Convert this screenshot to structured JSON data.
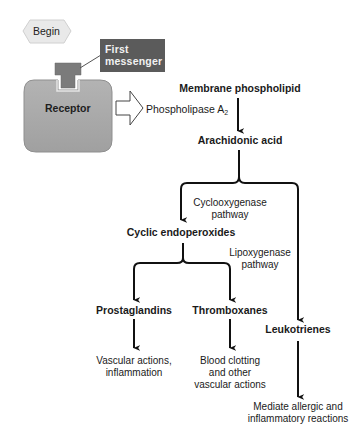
{
  "diagram": {
    "start": {
      "label": "Begin"
    },
    "first_messenger": {
      "line1": "First",
      "line2": "messenger"
    },
    "receptor": {
      "label": "Receptor"
    },
    "enzyme": {
      "label": "Phospholipase A",
      "subscript": "2"
    },
    "nodes": {
      "membrane_phospholipid": "Membrane phospholipid",
      "arachidonic_acid": "Arachidonic acid",
      "cyclic_endoperoxides": "Cyclic endoperoxides",
      "prostaglandins": "Prostaglandins",
      "thromboxanes": "Thromboxanes",
      "leukotrienes": "Leukotrienes"
    },
    "pathways": {
      "cyclooxygenase": {
        "line1": "Cyclooxygenase",
        "line2": "pathway"
      },
      "lipoxygenase": {
        "line1": "Lipoxygenase",
        "line2": "pathway"
      }
    },
    "effects": {
      "prostaglandins": {
        "line1": "Vascular actions,",
        "line2": "inflammation"
      },
      "thromboxanes": {
        "line1": "Blood clotting",
        "line2": "and other",
        "line3": "vascular actions"
      },
      "leukotrienes": {
        "line1": "Mediate allergic and",
        "line2": "inflammatory reactions"
      }
    },
    "colors": {
      "receptor_fill": "#a9a9a9",
      "receptor_stroke": "#8e8e8e",
      "messenger_box": "#5b5b5b",
      "ligand_fill": "#7b7b7b",
      "begin_fill": "#e9e9e9",
      "arrow": "#111111"
    }
  }
}
